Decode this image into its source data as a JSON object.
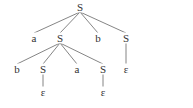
{
  "diagram": {
    "type": "parse-tree",
    "nodes": [
      {
        "id": "n0",
        "label": "S",
        "x": 80,
        "y": 7
      },
      {
        "id": "n1",
        "label": "a",
        "x": 34,
        "y": 38
      },
      {
        "id": "n2",
        "label": "S",
        "x": 60,
        "y": 38
      },
      {
        "id": "n3",
        "label": "b",
        "x": 98,
        "y": 38
      },
      {
        "id": "n4",
        "label": "S",
        "x": 126,
        "y": 38
      },
      {
        "id": "n5",
        "label": "b",
        "x": 17,
        "y": 69
      },
      {
        "id": "n6",
        "label": "S",
        "x": 43,
        "y": 69
      },
      {
        "id": "n7",
        "label": "a",
        "x": 77,
        "y": 69
      },
      {
        "id": "n8",
        "label": "S",
        "x": 103,
        "y": 69
      },
      {
        "id": "n9",
        "label": "ε",
        "x": 126,
        "y": 69
      },
      {
        "id": "n10",
        "label": "ε",
        "x": 43,
        "y": 92
      },
      {
        "id": "n11",
        "label": "ε",
        "x": 103,
        "y": 92
      }
    ],
    "edges": [
      [
        "n0",
        "n1"
      ],
      [
        "n0",
        "n2"
      ],
      [
        "n0",
        "n3"
      ],
      [
        "n0",
        "n4"
      ],
      [
        "n2",
        "n5"
      ],
      [
        "n2",
        "n6"
      ],
      [
        "n2",
        "n7"
      ],
      [
        "n2",
        "n8"
      ],
      [
        "n4",
        "n9"
      ],
      [
        "n6",
        "n10"
      ],
      [
        "n8",
        "n11"
      ]
    ]
  }
}
